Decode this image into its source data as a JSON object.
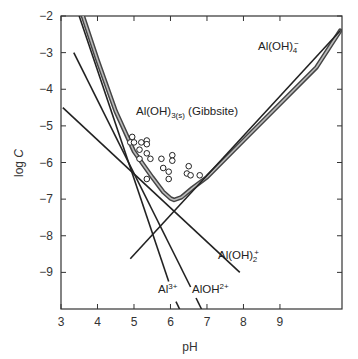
{
  "chart_data": {
    "type": "line",
    "title": "",
    "xlabel": "pH",
    "ylabel": "log C",
    "xlim": [
      3,
      10.7
    ],
    "ylim": [
      -10,
      -2
    ],
    "grid": false,
    "legend": "none (inline labels)",
    "x_ticks": [
      3,
      4,
      5,
      6,
      7,
      8,
      9
    ],
    "y_ticks": [
      -2,
      -3,
      -4,
      -5,
      -6,
      -7,
      -8,
      -9
    ],
    "x_tick_labels": [
      "3",
      "4",
      "5",
      "6",
      "7",
      "8",
      "9"
    ],
    "y_tick_labels": [
      "−2",
      "−3",
      "−4",
      "−5",
      "−6",
      "−7",
      "−8",
      "−9"
    ],
    "series": [
      {
        "name": "Al(OH)3(s) (Gibbsite) total solubility",
        "style": "thick double line",
        "x": [
          3.6,
          4.0,
          4.5,
          5.0,
          5.5,
          5.8,
          6.0,
          6.1,
          6.3,
          6.6,
          7.0,
          8.0,
          9.0,
          10.0,
          10.65
        ],
        "y": [
          -2.0,
          -3.2,
          -4.6,
          -5.7,
          -6.4,
          -6.8,
          -6.98,
          -7.02,
          -6.95,
          -6.7,
          -6.4,
          -5.4,
          -4.4,
          -3.4,
          -2.4
        ]
      },
      {
        "name": "Al³⁺",
        "slope": -3,
        "x": [
          3.5,
          5.95
        ],
        "y": [
          -2.0,
          -9.25
        ],
        "dash_below_label": {
          "x": [
            6.15,
            6.25
          ],
          "y": [
            -9.8,
            -10.0
          ]
        }
      },
      {
        "name": "AlOH²⁺",
        "slope": -2,
        "x": [
          3.35,
          6.55
        ],
        "y": [
          -3.0,
          -9.4
        ],
        "dash_below_label": {
          "x": [
            6.7,
            6.85
          ],
          "y": [
            -9.7,
            -10.0
          ]
        }
      },
      {
        "name": "Al(OH)₂⁺",
        "slope": -1,
        "x": [
          3.05,
          7.9
        ],
        "y": [
          -4.5,
          -9.0
        ]
      },
      {
        "name": "Al(OH)₄⁻",
        "slope": 1,
        "x": [
          4.9,
          10.65
        ],
        "y": [
          -8.63,
          -2.4
        ]
      }
    ],
    "scatter": {
      "name": "observed data",
      "marker": "open circle",
      "points": [
        [
          4.95,
          -5.3
        ],
        [
          4.9,
          -5.45
        ],
        [
          5.0,
          -5.45
        ],
        [
          5.2,
          -5.45
        ],
        [
          5.35,
          -5.4
        ],
        [
          5.35,
          -5.5
        ],
        [
          5.15,
          -5.65
        ],
        [
          5.35,
          -5.75
        ],
        [
          5.45,
          -5.9
        ],
        [
          5.15,
          -5.9
        ],
        [
          5.75,
          -5.9
        ],
        [
          6.05,
          -5.8
        ],
        [
          6.05,
          -5.95
        ],
        [
          5.8,
          -6.15
        ],
        [
          5.95,
          -6.25
        ],
        [
          5.95,
          -6.45
        ],
        [
          5.35,
          -6.45
        ],
        [
          6.5,
          -6.1
        ],
        [
          6.45,
          -6.3
        ],
        [
          6.55,
          -6.35
        ],
        [
          6.8,
          -6.35
        ]
      ]
    },
    "annotations": [
      {
        "text": "Al(OH)3(s) (Gibbsite)",
        "x": 5.05,
        "y": -4.9
      },
      {
        "text": "Al(OH)4⁻",
        "x": 8.3,
        "y": -2.9
      },
      {
        "text": "Al(OH)2⁺",
        "x": 7.45,
        "y": -8.3
      },
      {
        "text": "Al³⁺",
        "x": 5.9,
        "y": -9.3
      },
      {
        "text": "AlOH²⁺",
        "x": 6.5,
        "y": -9.3
      }
    ]
  },
  "labels": {
    "x_axis": "pH",
    "y_axis_main": "log ",
    "y_axis_italic": "C",
    "gibbsite_main": "Al(OH)",
    "gibbsite_sub": "3(s)",
    "gibbsite_tail": " (Gibbsite)",
    "aloh4_main": "Al(OH)",
    "aloh4_sup": "−",
    "aloh4_sub": "4",
    "aloh2_main": "Al(OH)",
    "aloh2_sup": "+",
    "aloh2_sub": "2",
    "al3_main": "Al",
    "al3_sup": "3+",
    "aloh_main": "AlOH",
    "aloh_sup": "2+"
  }
}
